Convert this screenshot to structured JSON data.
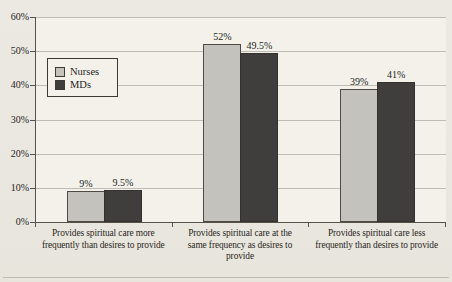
{
  "page": {
    "background": "#EAE7E0",
    "plot_background": "#F3F1EA"
  },
  "chart_data": {
    "type": "bar",
    "title": "",
    "xlabel": "",
    "ylabel": "",
    "categories": [
      "Provides spiritual care more\nfrequently than desires to provide",
      "Provides spiritual care at the\nsame frequency as desires to\nprovide",
      "Provides spiritual care less\nfrequently than desires to provide"
    ],
    "series": [
      {
        "name": "Nurses",
        "color": "#C3C2BD",
        "values": [
          9,
          52,
          39
        ],
        "labels": [
          "9%",
          "52%",
          "39%"
        ]
      },
      {
        "name": "MDs",
        "color": "#403E3C",
        "values": [
          9.5,
          49.5,
          41
        ],
        "labels": [
          "9.5%",
          "49.5%",
          "41%"
        ]
      }
    ],
    "ylim": [
      0,
      60
    ],
    "ytick_step": 10,
    "yticks": [
      "0%",
      "10%",
      "20%",
      "30%",
      "40%",
      "50%",
      "60%"
    ],
    "grid": true,
    "gridline_color": "#BFBCB4",
    "legend_position": "upper-left-inside"
  }
}
